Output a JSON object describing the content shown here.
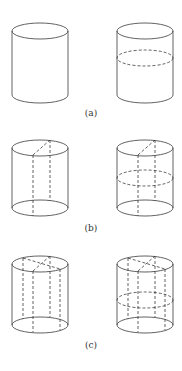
{
  "figure": {
    "panels": [
      {
        "label": "(a)",
        "description": "Cylinder alone; cylinder with horizontal dashed cross-section ellipse at mid-height"
      },
      {
        "label": "(b)",
        "description": "Cylinder with vertical dashed rectangular cut through axis (one diagonal on top); same with added horizontal dashed cross-section"
      },
      {
        "label": "(c)",
        "description": "Cylinder with two crossing vertical dashed cuts (four dashed verticals, two diagonals on top); same with added horizontal dashed cross-section"
      }
    ]
  },
  "colors": {
    "stroke": "#3a3a3a",
    "background": "#ffffff"
  }
}
